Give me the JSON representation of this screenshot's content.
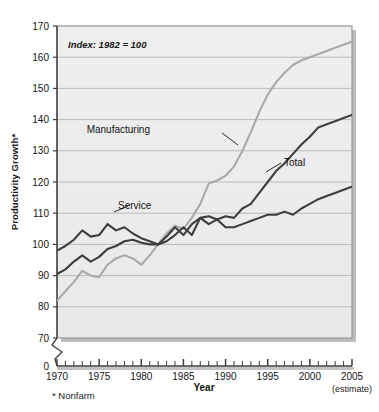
{
  "chart_data": {
    "type": "line",
    "title": "",
    "subtitle": "",
    "annotation": "Index: 1982 = 100",
    "xlabel": "Year",
    "ylabel": "Productivity Growth*",
    "footnote": "* Nonfarm",
    "estimate_note": "(estimate)",
    "grid": true,
    "legend_position": "inline-labels",
    "xlim": [
      1970,
      2005
    ],
    "ylim": [
      70,
      170
    ],
    "y_axis_break": true,
    "y_break_from": 0,
    "y_break_to": 70,
    "xticks": [
      1970,
      1975,
      1980,
      1985,
      1990,
      1995,
      2000,
      2005
    ],
    "xtick_labels": [
      "1970",
      "1975",
      "1980",
      "1985",
      "1990",
      "1995",
      "2000",
      "2005"
    ],
    "x_minor_tick_interval": 1,
    "yticks": [
      0,
      70,
      80,
      90,
      100,
      110,
      120,
      130,
      140,
      150,
      160,
      170
    ],
    "ytick_labels": [
      "0",
      "70",
      "80",
      "90",
      "100",
      "110",
      "120",
      "130",
      "140",
      "150",
      "160",
      "170"
    ],
    "x": [
      1970,
      1971,
      1972,
      1973,
      1974,
      1975,
      1976,
      1977,
      1978,
      1979,
      1980,
      1981,
      1982,
      1983,
      1984,
      1985,
      1986,
      1987,
      1988,
      1989,
      1990,
      1991,
      1992,
      1993,
      1994,
      1995,
      1996,
      1997,
      1998,
      1999,
      2000,
      2001,
      2002,
      2003,
      2004,
      2005
    ],
    "series": [
      {
        "name": "Manufacturing",
        "color": "#a9a9a9",
        "label_color": "#111111",
        "values": [
          82.0,
          85.0,
          88.0,
          91.5,
          90.0,
          89.5,
          93.5,
          95.5,
          96.5,
          95.5,
          93.5,
          96.5,
          100.0,
          103.5,
          106.0,
          105.0,
          108.5,
          113.0,
          119.5,
          120.5,
          122.0,
          125.0,
          130.0,
          136.0,
          142.5,
          148.0,
          152.0,
          155.0,
          157.5,
          159.0,
          160.0,
          161.0,
          162.0,
          163.0,
          164.0,
          165.0
        ]
      },
      {
        "name": "Total",
        "color": "#3d3d3d",
        "label_color": "#111111",
        "values": [
          90.5,
          92.0,
          94.5,
          96.5,
          94.5,
          96.0,
          98.5,
          99.5,
          101.0,
          101.5,
          100.5,
          100.0,
          100.0,
          102.5,
          105.5,
          103.0,
          106.5,
          108.5,
          109.0,
          108.0,
          109.0,
          108.5,
          111.5,
          113.0,
          116.5,
          120.0,
          123.5,
          126.0,
          129.0,
          132.0,
          134.5,
          137.5,
          138.5,
          139.5,
          140.5,
          141.5
        ]
      },
      {
        "name": "Service",
        "color": "#3d3d3d",
        "label_color": "#111111",
        "values": [
          98.0,
          99.5,
          101.5,
          104.5,
          102.5,
          103.0,
          106.5,
          104.5,
          105.5,
          103.5,
          102.0,
          101.0,
          100.0,
          101.0,
          103.0,
          105.5,
          103.0,
          108.5,
          106.5,
          108.0,
          105.5,
          105.5,
          106.5,
          107.5,
          108.5,
          109.5,
          109.5,
          110.5,
          109.5,
          111.5,
          113.0,
          114.5,
          115.5,
          116.5,
          117.5,
          118.5
        ]
      }
    ]
  },
  "labels": {
    "manufacturing": "Manufacturing",
    "total": "Total",
    "service": "Service"
  }
}
